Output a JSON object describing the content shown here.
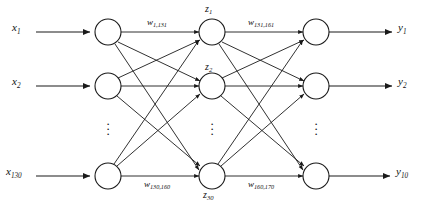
{
  "figure": {
    "type": "neural-network-diagram",
    "title": "",
    "background_color": "#ffffff",
    "stroke_color": "#1a1a1a",
    "width": 424,
    "height": 210
  },
  "layers": {
    "input": {
      "name": "input-layer",
      "node_count_shown": 3,
      "total_units": 130,
      "labels": [
        {
          "base": "x",
          "sub": "1"
        },
        {
          "base": "x",
          "sub": "2"
        },
        {
          "base": "x",
          "sub": "130"
        }
      ],
      "ellipsis": "vertical-dots"
    },
    "hidden": {
      "name": "hidden-layer",
      "node_count_shown": 3,
      "total_units": 30,
      "labels": [
        {
          "base": "z",
          "sub": "1"
        },
        {
          "base": "z",
          "sub": "2"
        },
        {
          "base": "z",
          "sub": "30"
        }
      ],
      "ellipsis": "vertical-dots"
    },
    "output": {
      "name": "output-layer",
      "node_count_shown": 3,
      "total_units": 10,
      "labels": [
        {
          "base": "y",
          "sub": "1"
        },
        {
          "base": "y",
          "sub": "2"
        },
        {
          "base": "y",
          "sub": "10"
        }
      ],
      "ellipsis": "vertical-dots"
    }
  },
  "weights": [
    {
      "id": "w-input-top",
      "base": "w",
      "sub": "1,131"
    },
    {
      "id": "w-hidden-top",
      "base": "w",
      "sub": "131,161"
    },
    {
      "id": "w-input-bottom",
      "base": "w",
      "sub": "130,160"
    },
    {
      "id": "w-hidden-bottom",
      "base": "w",
      "sub": "160,170"
    }
  ]
}
